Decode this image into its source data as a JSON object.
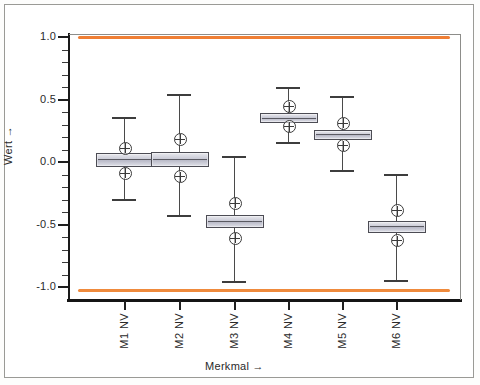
{
  "chart_data": {
    "type": "box",
    "title": "",
    "xlabel": "Merkmal",
    "xlabel_arrow": "→",
    "ylabel": "Wert",
    "ylabel_arrow": "→",
    "ylim": [
      -1.15,
      1.15
    ],
    "grid": false,
    "legend": "none",
    "ytick_labels": [
      "1.0",
      "0.5",
      "0.0",
      "-0.5",
      "-1.0"
    ],
    "ytick_values": [
      1.0,
      0.5,
      0.0,
      -0.5,
      -1.0
    ],
    "yminor_step": 0.1,
    "categories": [
      "M1 NV",
      "M2 NV",
      "M3 NV",
      "M4 NV",
      "M5 NV",
      "M6 NV"
    ],
    "reference_lines": [
      {
        "value": 1.0,
        "color": "#ef7e34",
        "label": ""
      },
      {
        "value": -1.02,
        "color": "#ef8a3c",
        "label": ""
      }
    ],
    "box_fill": "#c9cad6",
    "box_edge": "#4c4c54",
    "boxes": [
      {
        "category": "M1 NV",
        "whisker_high": 0.35,
        "q3": 0.07,
        "median": 0.02,
        "q1": -0.02,
        "whisker_low": -0.3,
        "markers": [
          0.12,
          -0.08
        ]
      },
      {
        "category": "M2 NV",
        "whisker_high": 0.54,
        "q3": 0.08,
        "median": 0.03,
        "q1": -0.02,
        "whisker_low": -0.43,
        "markers": [
          0.19,
          -0.11
        ]
      },
      {
        "category": "M3 NV",
        "whisker_high": 0.04,
        "q3": -0.42,
        "median": -0.46,
        "q1": -0.51,
        "whisker_low": -0.96,
        "markers": [
          -0.32,
          -0.6
        ]
      },
      {
        "category": "M4 NV",
        "whisker_high": 0.59,
        "q3": 0.39,
        "median": 0.36,
        "q1": 0.33,
        "whisker_low": 0.15,
        "markers": [
          0.45,
          0.29
        ]
      },
      {
        "category": "M5 NV",
        "whisker_high": 0.52,
        "q3": 0.26,
        "median": 0.23,
        "q1": 0.19,
        "whisker_low": -0.07,
        "markers": [
          0.32,
          0.14
        ]
      },
      {
        "category": "M6 NV",
        "whisker_high": -0.1,
        "q3": -0.47,
        "median": -0.51,
        "q1": -0.55,
        "whisker_low": -0.95,
        "markers": [
          -0.38,
          -0.62
        ]
      }
    ]
  }
}
